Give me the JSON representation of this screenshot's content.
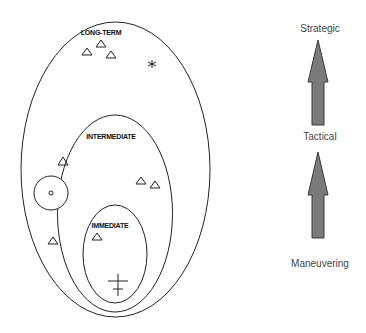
{
  "diagram": {
    "regions": [
      {
        "id": "long-term",
        "label": "LONG-TERM"
      },
      {
        "id": "intermediate",
        "label": "INTERMEDIATE"
      },
      {
        "id": "immediate",
        "label": "IMMEDIATE"
      }
    ],
    "symbols": {
      "triangle": "△",
      "star": "*",
      "circle_marker": "o",
      "cross": "cross"
    },
    "levels": [
      {
        "id": "strategic",
        "label": "Strategic"
      },
      {
        "id": "tactical",
        "label": "Tactical"
      },
      {
        "id": "maneuvering",
        "label": "Maneuvering"
      }
    ],
    "colors": {
      "line": "#222222",
      "arrow_fill": "#7a7a7a",
      "arrow_stroke": "#3a3a3a",
      "label_text": "#444444"
    }
  }
}
